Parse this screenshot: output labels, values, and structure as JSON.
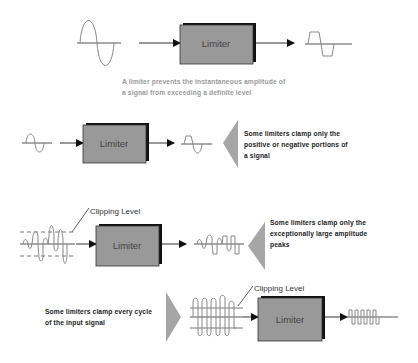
{
  "diagram": {
    "block_label": "Limiter",
    "colors": {
      "block_fill": "#999999",
      "block_shadow": "#111111",
      "pointer_gray": "#a6a6a6",
      "wave_stroke": "#777777",
      "line": "#333333"
    },
    "main": {
      "caption_line1": "A limiter prevents the instantaneous amplitude of",
      "caption_line2": "a signal from exceeding a definite level"
    },
    "examples": [
      {
        "caption_line1": "Some limiters clamp only the",
        "caption_line2": "positive or negative portions of",
        "caption_line3": "a signal"
      },
      {
        "clipping_label": "Clipping Level",
        "caption_line1": "Some limiters clamp only the",
        "caption_line2": "exceptionally large amplitude",
        "caption_line3": "peaks"
      },
      {
        "clipping_label": "Clipping Level",
        "caption_line1": "Some limiters clamp every cycle",
        "caption_line2": "of the input signal"
      }
    ]
  }
}
